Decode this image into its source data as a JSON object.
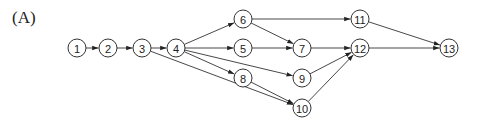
{
  "figure_label": "(A)",
  "nodes": [
    {
      "id": "1",
      "x": 77,
      "y": 48
    },
    {
      "id": "2",
      "x": 108,
      "y": 48
    },
    {
      "id": "3",
      "x": 142,
      "y": 48
    },
    {
      "id": "4",
      "x": 176,
      "y": 48
    },
    {
      "id": "5",
      "x": 243,
      "y": 48
    },
    {
      "id": "6",
      "x": 243,
      "y": 19
    },
    {
      "id": "7",
      "x": 302,
      "y": 48
    },
    {
      "id": "8",
      "x": 243,
      "y": 78
    },
    {
      "id": "9",
      "x": 302,
      "y": 78
    },
    {
      "id": "10",
      "x": 302,
      "y": 108
    },
    {
      "id": "11",
      "x": 360,
      "y": 19
    },
    {
      "id": "12",
      "x": 360,
      "y": 48
    },
    {
      "id": "13",
      "x": 449,
      "y": 48
    }
  ],
  "edges": [
    [
      "1",
      "2"
    ],
    [
      "2",
      "3"
    ],
    [
      "3",
      "4"
    ],
    [
      "3",
      "10"
    ],
    [
      "4",
      "6"
    ],
    [
      "4",
      "5"
    ],
    [
      "4",
      "8"
    ],
    [
      "4",
      "9"
    ],
    [
      "6",
      "7"
    ],
    [
      "6",
      "11"
    ],
    [
      "5",
      "7"
    ],
    [
      "7",
      "12"
    ],
    [
      "8",
      "10"
    ],
    [
      "9",
      "12"
    ],
    [
      "10",
      "12"
    ],
    [
      "11",
      "13"
    ],
    [
      "12",
      "13"
    ]
  ]
}
